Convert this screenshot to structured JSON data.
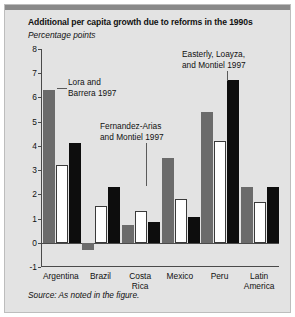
{
  "figure": {
    "title": "Additional per capita growth due to reforms in the 1990s",
    "subtitle": "Percentage points",
    "source": "Source: As noted in the figure."
  },
  "annotations": [
    {
      "text": "Lora and\nBarrera 1997"
    },
    {
      "text": "Fernandez-Arias\nand Montiel 1997"
    },
    {
      "text": "Easterly, Loayza,\nand Montiel 1997"
    }
  ],
  "colors": {
    "series_lora": "#6b6b6b",
    "series_fernandez": "#ffffff",
    "series_easterly": "#0d0d0d",
    "panel_background": "#e3e3e3",
    "axis": "#4a4a4a"
  },
  "chart_data": {
    "type": "bar",
    "title": "Additional per capita growth due to reforms in the 1990s",
    "subtitle": "Percentage points",
    "xlabel": "",
    "ylabel": "Percentage points",
    "ylim": [
      -1,
      8
    ],
    "yticks": [
      -1,
      0,
      1,
      2,
      3,
      4,
      5,
      6,
      7,
      8
    ],
    "grid": false,
    "legend": "annotations in figure",
    "categories": [
      "Argentina",
      "Brazil",
      "Costa\nRica",
      "Mexico",
      "Peru",
      "Latin\nAmerica"
    ],
    "series": [
      {
        "name": "Lora and Barrera 1997",
        "color": "#6b6b6b",
        "values": [
          6.3,
          -0.3,
          0.75,
          3.5,
          5.4,
          2.3
        ]
      },
      {
        "name": "Fernandez-Arias and Montiel 1997",
        "color": "#ffffff",
        "values": [
          3.2,
          1.5,
          1.3,
          1.8,
          4.2,
          1.7
        ]
      },
      {
        "name": "Easterly, Loayza, and Montiel 1997",
        "color": "#0d0d0d",
        "values": [
          4.1,
          2.3,
          0.85,
          1.05,
          6.7,
          2.3
        ]
      }
    ]
  }
}
